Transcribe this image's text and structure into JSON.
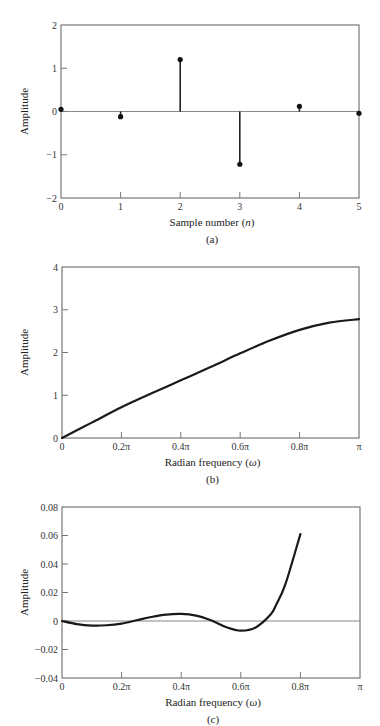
{
  "chart_data": [
    {
      "id": "a",
      "type": "stem",
      "caption": "(a)",
      "xlabel_prefix": "Sample number (",
      "xlabel_var": "n",
      "xlabel_suffix": ")",
      "ylabel": "Amplitude",
      "xlim": [
        0,
        5
      ],
      "ylim": [
        -2,
        2
      ],
      "xticks": [
        0,
        1,
        2,
        3,
        4,
        5
      ],
      "xtick_labels": [
        "0",
        "1",
        "2",
        "3",
        "4",
        "5"
      ],
      "yticks": [
        -2,
        -1,
        0,
        1,
        2
      ],
      "ytick_labels": [
        "−2",
        "−1",
        "0",
        "1",
        "2"
      ],
      "grid": false,
      "zero_line": true,
      "x": [
        0,
        1,
        2,
        3,
        4,
        5
      ],
      "values": [
        0.05,
        -0.12,
        1.2,
        -1.22,
        0.12,
        -0.04
      ],
      "frame": {
        "left": 61,
        "top": 25,
        "right": 359,
        "bottom": 198
      }
    },
    {
      "id": "b",
      "type": "line",
      "caption": "(b)",
      "xlabel_prefix": "Radian frequency (",
      "xlabel_var": "ω",
      "xlabel_suffix": ")",
      "ylabel": "Amplitude",
      "xlim": [
        0,
        1
      ],
      "ylim": [
        0,
        4
      ],
      "xticks": [
        0,
        0.2,
        0.4,
        0.6,
        0.8,
        1.0
      ],
      "xtick_labels": [
        "0",
        "0.2π",
        "0.4π",
        "0.6π",
        "0.8π",
        "π"
      ],
      "yticks": [
        0,
        1,
        2,
        3,
        4
      ],
      "ytick_labels": [
        "0",
        "1",
        "2",
        "3",
        "4"
      ],
      "grid": false,
      "zero_line": false,
      "x_units": "fraction of π",
      "x": [
        0,
        0.1,
        0.2,
        0.3,
        0.4,
        0.5,
        0.6,
        0.7,
        0.8,
        0.9,
        1.0
      ],
      "values": [
        0,
        0.36,
        0.72,
        1.04,
        1.35,
        1.66,
        1.98,
        2.28,
        2.53,
        2.7,
        2.78
      ],
      "frame": {
        "left": 62,
        "top": 267,
        "right": 359,
        "bottom": 438
      }
    },
    {
      "id": "c",
      "type": "line",
      "caption": "(c)",
      "xlabel_prefix": "Radian frequency (",
      "xlabel_var": "ω",
      "xlabel_suffix": ")",
      "ylabel": "Amplitude",
      "xlim": [
        0,
        1
      ],
      "ylim": [
        -0.04,
        0.08
      ],
      "xticks": [
        0,
        0.2,
        0.4,
        0.6,
        0.8,
        1.0
      ],
      "xtick_labels": [
        "0",
        "0.2π",
        "0.4π",
        "0.6π",
        "0.8π",
        "π"
      ],
      "yticks": [
        -0.04,
        -0.02,
        0,
        0.02,
        0.04,
        0.06,
        0.08
      ],
      "ytick_labels": [
        "−0.04",
        "−0.02",
        "0",
        "0.02",
        "0.04",
        "0.06",
        "0.08"
      ],
      "grid": false,
      "zero_line": true,
      "x_units": "fraction of π",
      "x": [
        0,
        0.05,
        0.1,
        0.15,
        0.2,
        0.25,
        0.3,
        0.35,
        0.4,
        0.45,
        0.5,
        0.55,
        0.6,
        0.65,
        0.7,
        0.72,
        0.75,
        0.8
      ],
      "values": [
        0,
        -0.0022,
        -0.0032,
        -0.003,
        -0.0018,
        0.0005,
        0.0028,
        0.0045,
        0.005,
        0.0038,
        0.0005,
        -0.0042,
        -0.0068,
        -0.0045,
        0.0045,
        0.012,
        0.026,
        0.061
      ],
      "frame": {
        "left": 62,
        "top": 507,
        "right": 360,
        "bottom": 678
      }
    }
  ]
}
